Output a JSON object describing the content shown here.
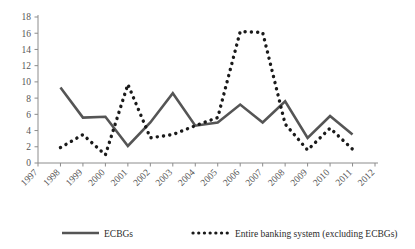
{
  "chart_data": {
    "type": "line",
    "title": "",
    "subtitle": "",
    "xlabel": "",
    "ylabel": "",
    "xlim": [
      1997,
      2012
    ],
    "ylim": [
      0,
      18
    ],
    "ytick_step": 2,
    "grid": false,
    "legend_position": "bottom",
    "x": [
      1997,
      1998,
      1999,
      2000,
      2001,
      2002,
      2003,
      2004,
      2005,
      2006,
      2007,
      2008,
      2009,
      2010,
      2011,
      2012
    ],
    "xticks": [
      "1997",
      "1998",
      "1999",
      "2000",
      "2001",
      "2002",
      "2003",
      "2004",
      "2005",
      "2006",
      "2007",
      "2008",
      "2009",
      "2010",
      "2011",
      "2012"
    ],
    "yticks": [
      "0",
      "2",
      "4",
      "6",
      "8",
      "10",
      "12",
      "14",
      "16",
      "18"
    ],
    "series": [
      {
        "name": "ECBGs",
        "style": "solid",
        "color": "#555555",
        "x": [
          1998,
          1999,
          2000,
          2001,
          2002,
          2003,
          2004,
          2005,
          2006,
          2007,
          2008,
          2009,
          2010,
          2011
        ],
        "values": [
          9.3,
          5.6,
          5.7,
          2.1,
          5.0,
          8.6,
          4.6,
          5.0,
          7.2,
          5.0,
          7.6,
          3.1,
          5.8,
          3.5
        ]
      },
      {
        "name": "Entire banking system (excluding ECBGs)",
        "style": "dotted",
        "color": "#1a1a1a",
        "x": [
          1998,
          1999,
          2000,
          2001,
          2002,
          2003,
          2004,
          2005,
          2006,
          2007,
          2008,
          2009,
          2010,
          2011
        ],
        "values": [
          1.9,
          3.5,
          1.0,
          9.7,
          3.1,
          3.5,
          4.6,
          5.6,
          16.2,
          16.1,
          4.8,
          1.6,
          4.3,
          1.7
        ]
      }
    ]
  },
  "legend": {
    "items": [
      {
        "label": "ECBGs",
        "style": "solid"
      },
      {
        "label": "Entire banking system (excluding ECBGs)",
        "style": "dotted"
      }
    ]
  }
}
